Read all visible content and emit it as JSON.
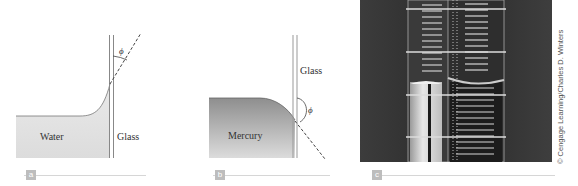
{
  "figure": {
    "panels": [
      {
        "id": "a",
        "label": "a",
        "liquid_label": "Water",
        "wall_label": "Glass",
        "angle_symbol": "ϕ",
        "liquid_color": "#e6e6e6",
        "meniscus": "concave"
      },
      {
        "id": "b",
        "label": "b",
        "liquid_label": "Mercury",
        "wall_label": "Glass",
        "angle_symbol": "ϕ",
        "liquid_color": "#9a9a9a",
        "meniscus": "convex"
      },
      {
        "id": "c",
        "label": "c",
        "credit": "© Cengage Learning/Charles D. Winters"
      }
    ],
    "colors": {
      "label_box": "#bdbdbd",
      "label_line": "#d6d6d6",
      "photo_background": "#3a3a3a"
    }
  }
}
